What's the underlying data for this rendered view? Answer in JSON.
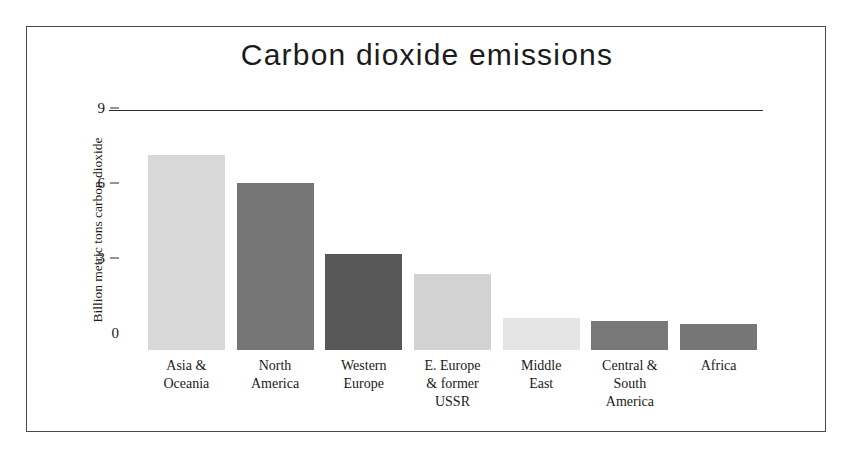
{
  "chart_data": {
    "type": "bar",
    "title": "Carbon dioxide emissions",
    "xlabel": "",
    "ylabel": "Billion metric tons carbon dioxide",
    "categories": [
      "Asia &\nOceania",
      "North\nAmerica",
      "Western\nEurope",
      "E. Europe\n& former\nUSSR",
      "Middle\nEast",
      "Central &\nSouth\nAmerica",
      "Africa"
    ],
    "category_lines": [
      [
        "Asia &",
        "Oceania"
      ],
      [
        "North",
        "America"
      ],
      [
        "Western",
        "Europe"
      ],
      [
        "E. Europe",
        "& former",
        "USSR"
      ],
      [
        "Middle",
        "East"
      ],
      [
        "Central &",
        "South",
        "America"
      ],
      [
        "Africa"
      ]
    ],
    "values": [
      7.8,
      6.7,
      3.85,
      3.05,
      1.3,
      1.15,
      1.05
    ],
    "bar_colors": [
      "#d8d8d8",
      "#757575",
      "#575757",
      "#d2d2d2",
      "#e4e4e4",
      "#787878",
      "#767676"
    ],
    "ylim": [
      0,
      9.6
    ],
    "yticks": [
      0,
      3,
      6,
      9
    ],
    "ytick_labels": [
      "0",
      "3",
      "6",
      "9"
    ],
    "grid": false,
    "legend": false,
    "legend_position": "none"
  },
  "figure": {
    "border_color": "#4a4a4a",
    "background": "#ffffff",
    "axis_color": "#2b2b2b"
  }
}
